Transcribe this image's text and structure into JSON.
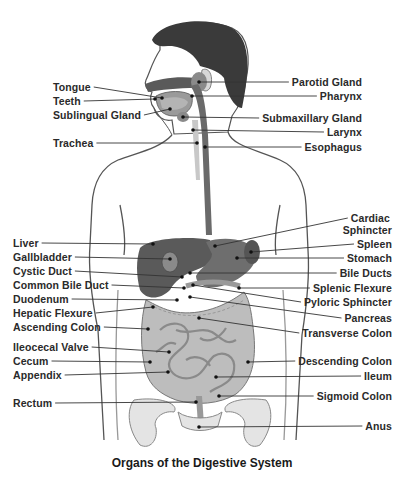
{
  "title": "Organs of the Digestive System",
  "colors": {
    "label_text": "#2a2a2a",
    "leader_line": "#333333",
    "hair": "#3a3a3a",
    "organ_dark": "#5a5a5a",
    "organ_mid": "#8c8c8c",
    "organ_light": "#b8b8b8",
    "skin_outline": "#555555",
    "background": "#ffffff"
  },
  "labels_left": [
    {
      "text": "Tongue",
      "x": 53,
      "y": 81,
      "point": [
        162,
        98
      ]
    },
    {
      "text": "Teeth",
      "x": 53,
      "y": 95,
      "point": [
        155,
        99
      ]
    },
    {
      "text": "Sublingual Gland",
      "x": 53,
      "y": 109,
      "point": [
        170,
        109
      ]
    },
    {
      "text": "Trachea",
      "x": 53,
      "y": 137,
      "point": [
        197,
        143
      ]
    },
    {
      "text": "Liver",
      "x": 13,
      "y": 237,
      "point": [
        153,
        244
      ]
    },
    {
      "text": "Gallbladder",
      "x": 13,
      "y": 251,
      "point": [
        170,
        259
      ]
    },
    {
      "text": "Cystic Duct",
      "x": 13,
      "y": 265,
      "point": [
        182,
        277
      ]
    },
    {
      "text": "Common Bile Duct",
      "x": 13,
      "y": 279,
      "point": [
        184,
        288
      ]
    },
    {
      "text": "Duodenum",
      "x": 13,
      "y": 293,
      "point": [
        177,
        300
      ]
    },
    {
      "text": "Hepatic Flexure",
      "x": 13,
      "y": 307,
      "point": [
        153,
        307
      ]
    },
    {
      "text": "Ascending Colon",
      "x": 13,
      "y": 321,
      "point": [
        148,
        329
      ]
    },
    {
      "text": "Ileocecal Valve",
      "x": 13,
      "y": 341,
      "point": [
        169,
        352
      ]
    },
    {
      "text": "Cecum",
      "x": 13,
      "y": 355,
      "point": [
        150,
        362
      ]
    },
    {
      "text": "Appendix",
      "x": 13,
      "y": 369,
      "point": [
        168,
        372
      ]
    },
    {
      "text": "Rectum",
      "x": 13,
      "y": 397,
      "point": [
        196,
        402
      ]
    }
  ],
  "labels_right": [
    {
      "text": "Parotid Gland",
      "right": 42,
      "y": 76,
      "point": [
        199,
        82
      ]
    },
    {
      "text": "Pharynx",
      "right": 42,
      "y": 90,
      "point": [
        192,
        96
      ]
    },
    {
      "text": "Submaxillary Gland",
      "right": 42,
      "y": 112,
      "point": [
        183,
        117
      ]
    },
    {
      "text": "Larynx",
      "right": 42,
      "y": 126,
      "point": [
        193,
        130
      ]
    },
    {
      "text": "Esophagus",
      "right": 42,
      "y": 141,
      "point": [
        205,
        147
      ]
    },
    {
      "text": "Cardiac",
      "right": 14,
      "y": 212,
      "point": [
        215,
        246
      ]
    },
    {
      "text": "Sphincter",
      "right": 12,
      "y": 224,
      "point": null
    },
    {
      "text": "Spleen",
      "right": 12,
      "y": 238,
      "point": [
        251,
        252
      ]
    },
    {
      "text": "Stomach",
      "right": 12,
      "y": 252,
      "point": [
        237,
        258
      ]
    },
    {
      "text": "Bile Ducts",
      "right": 12,
      "y": 267,
      "point": [
        190,
        273
      ]
    },
    {
      "text": "Splenic Flexure",
      "right": 12,
      "y": 282,
      "point": [
        239,
        288
      ]
    },
    {
      "text": "Pyloric Sphincter",
      "right": 12,
      "y": 296,
      "point": [
        193,
        285
      ]
    },
    {
      "text": "Pancreas",
      "right": 12,
      "y": 312,
      "point": [
        190,
        297
      ]
    },
    {
      "text": "Transverse Colon",
      "right": 12,
      "y": 327,
      "point": [
        199,
        318
      ]
    },
    {
      "text": "Descending Colon",
      "right": 12,
      "y": 355,
      "point": [
        248,
        362
      ]
    },
    {
      "text": "Ileum",
      "right": 12,
      "y": 370,
      "point": [
        216,
        377
      ]
    },
    {
      "text": "Sigmoid Colon",
      "right": 12,
      "y": 390,
      "point": [
        219,
        396
      ]
    },
    {
      "text": "Anus",
      "right": 12,
      "y": 420,
      "point": [
        199,
        427
      ]
    }
  ]
}
